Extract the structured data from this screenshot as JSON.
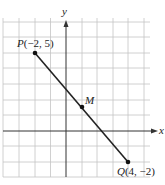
{
  "diagram": {
    "type": "coordinate-plane",
    "axes": {
      "x_label": "x",
      "y_label": "y"
    },
    "grid": {
      "x_min": -4,
      "x_max": 5.5,
      "y_min": -3,
      "y_max": 7.3,
      "spacing": 1
    },
    "points": [
      {
        "name": "P",
        "x": -2,
        "y": 5,
        "label": "P(−2, 5)"
      },
      {
        "name": "M",
        "x": 1,
        "y": 1.5,
        "label": "M"
      },
      {
        "name": "Q",
        "x": 4,
        "y": -2,
        "label": "Q(4, −2)"
      }
    ],
    "segment": {
      "from": "P",
      "to": "Q"
    },
    "colors": {
      "grid": "#bdbdbd",
      "axis": "#333333",
      "segment": "#222222"
    }
  },
  "labels": {
    "x_axis": "x",
    "y_axis": "y",
    "P_letter": "P",
    "P_coords": "(−2, 5)",
    "M": "M",
    "Q_letter": "Q",
    "Q_coords": "(4, −2)"
  }
}
